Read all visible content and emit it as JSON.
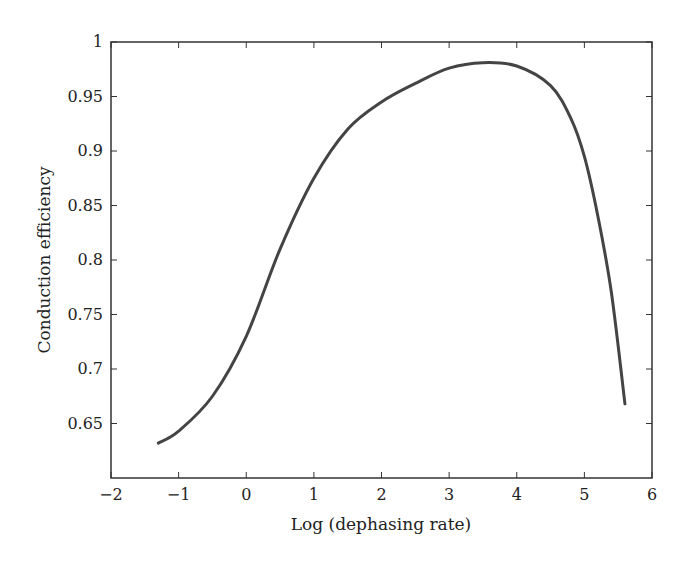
{
  "chart_data": {
    "type": "line",
    "title": "",
    "xlabel": "Log (dephasing rate)",
    "ylabel": "Conduction efficiency",
    "xlim": [
      -2,
      6
    ],
    "ylim": [
      0.6,
      1.0
    ],
    "xticks": [
      "−2",
      "−1",
      "0",
      "1",
      "2",
      "3",
      "4",
      "5",
      "6"
    ],
    "yticks": [
      "0.65",
      "0.7",
      "0.75",
      "0.8",
      "0.85",
      "0.9",
      "0.95",
      "1"
    ],
    "grid": false,
    "legend": null,
    "series": [
      {
        "name": "conduction efficiency",
        "color": "#444444",
        "x": [
          -1.3,
          -1.0,
          -0.5,
          0.0,
          0.5,
          1.0,
          1.5,
          2.0,
          2.5,
          3.0,
          3.5,
          4.0,
          4.5,
          4.8,
          5.0,
          5.2,
          5.4,
          5.6
        ],
        "y": [
          0.632,
          0.643,
          0.675,
          0.73,
          0.81,
          0.875,
          0.92,
          0.945,
          0.962,
          0.976,
          0.981,
          0.978,
          0.96,
          0.93,
          0.895,
          0.84,
          0.77,
          0.668
        ]
      }
    ]
  }
}
